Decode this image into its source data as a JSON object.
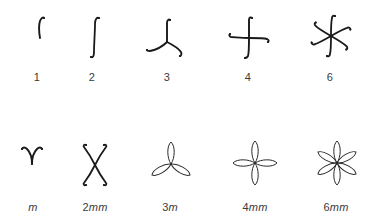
{
  "figure": {
    "stroke_color": "#1a1a1a",
    "label_color": "#3a3a3a",
    "top_row": {
      "name": "cyclic rotation groups",
      "items": [
        {
          "label": "1",
          "order": 1,
          "glyph": "single-arm-icon"
        },
        {
          "label": "2",
          "order": 2,
          "glyph": "two-fold-s-curve-icon"
        },
        {
          "label": "3",
          "order": 3,
          "glyph": "three-fold-pinwheel-icon"
        },
        {
          "label": "4",
          "order": 4,
          "glyph": "four-fold-pinwheel-icon"
        },
        {
          "label": "6",
          "order": 6,
          "glyph": "six-fold-pinwheel-icon"
        }
      ]
    },
    "bottom_row": {
      "name": "dihedral groups with mirror lines",
      "items": [
        {
          "label_num": "",
          "label_suffix": "m",
          "glyph": "v-shaped-mirror-icon"
        },
        {
          "label_num": "2",
          "label_suffix": "mm",
          "glyph": "x-shaped-mirror-icon"
        },
        {
          "label_num": "3",
          "label_suffix": "m",
          "glyph": "three-petal-icon"
        },
        {
          "label_num": "4",
          "label_suffix": "mm",
          "glyph": "four-petal-icon"
        },
        {
          "label_num": "6",
          "label_suffix": "mm",
          "glyph": "six-petal-icon"
        }
      ]
    }
  }
}
